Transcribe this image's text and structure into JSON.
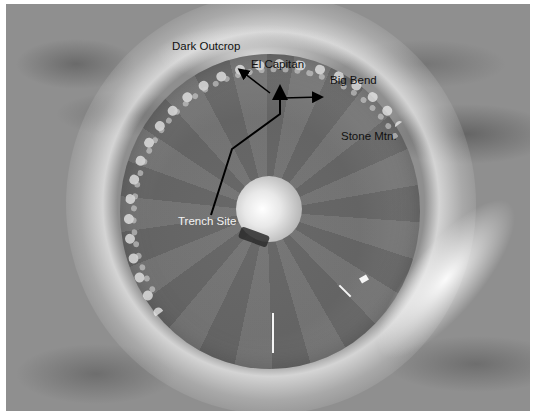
{
  "image": {
    "description": "Grayscale panoramic mosaic of a crater with annotated features",
    "colors": {
      "background": "#8f8f8f",
      "rim": "#ebebeb",
      "floor": "#6f6f6f",
      "annotation_line": "#000000",
      "label_dark": "#111111",
      "label_light": "#f2f2f2"
    }
  },
  "labels": {
    "dark_outcrop": "Dark Outcrop",
    "el_capitan": "El Capitan",
    "big_bend": "Big Bend",
    "stone_mtn": "Stone Mtn.",
    "trench_site": "Trench Site"
  },
  "annotations": {
    "path_points": [
      [
        211,
        215
      ],
      [
        232,
        149
      ],
      [
        280,
        114
      ],
      [
        280,
        86
      ]
    ],
    "arrows": [
      {
        "name": "to-dark-outcrop",
        "from": [
          270,
          93
        ],
        "to": [
          238,
          69
        ]
      },
      {
        "name": "to-big-bend",
        "from": [
          283,
          98
        ],
        "to": [
          323,
          97
        ]
      }
    ]
  }
}
